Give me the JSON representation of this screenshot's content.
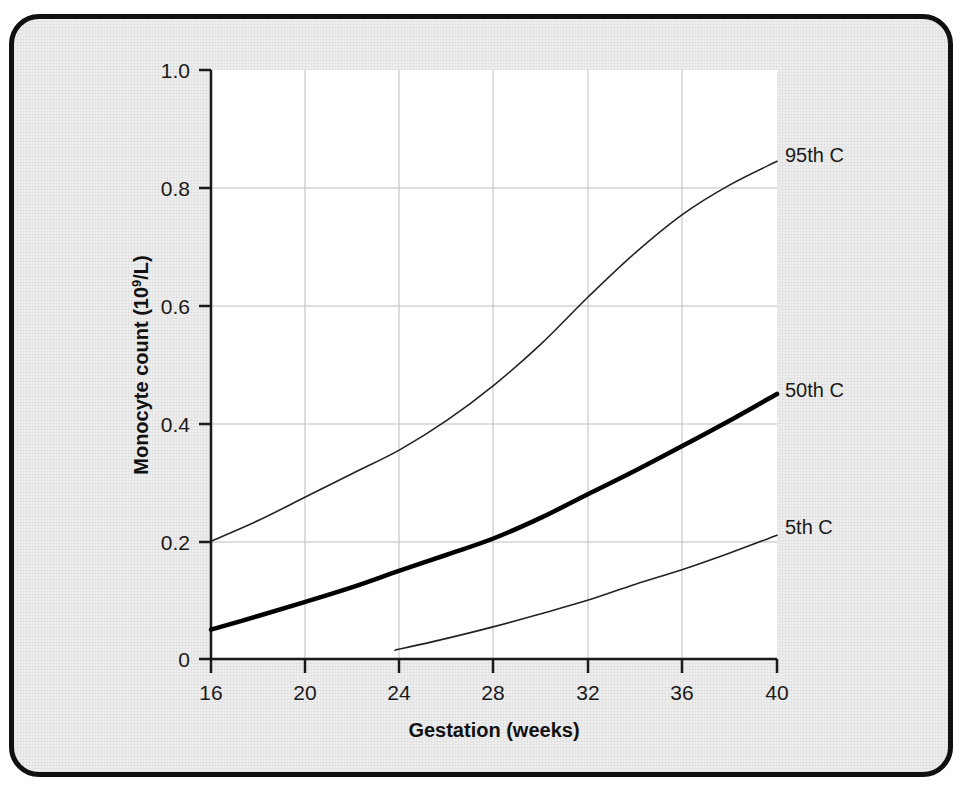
{
  "figure": {
    "frame_color": "#111111",
    "background_color": "#eeeeee",
    "plot_background_color": "#ffffff",
    "grid_color": "#b9b9b9",
    "axis_color": "#1a1a1a"
  },
  "axes": {
    "y_title_main": "Monocyte count (10",
    "y_title_sup": "9",
    "y_title_tail": "/L)",
    "y_title_full": "Monocyte count (10⁹/L)",
    "x_title": "Gestation (weeks)",
    "y_ticks": [
      "0",
      "0.2",
      "0.4",
      "0.6",
      "0.8",
      "1.0"
    ],
    "x_ticks": [
      "16",
      "20",
      "24",
      "28",
      "32",
      "36",
      "40"
    ]
  },
  "labels": {
    "p95": "95th C",
    "p50": "50th C",
    "p5": "5th C"
  },
  "chart_data": {
    "type": "line",
    "title": "",
    "subtitle": "",
    "xlabel": "Gestation (weeks)",
    "ylabel": "Monocyte count (10⁹/L)",
    "xlim": [
      16,
      40
    ],
    "ylim": [
      0,
      1.0
    ],
    "xticks": [
      16,
      20,
      24,
      28,
      32,
      36,
      40
    ],
    "yticks": [
      0,
      0.2,
      0.4,
      0.6,
      0.8,
      1.0
    ],
    "grid": true,
    "legend_position": "right-inline-labels",
    "x": [
      16,
      18,
      20,
      22,
      24,
      26,
      28,
      30,
      32,
      34,
      36,
      38,
      40
    ],
    "series": [
      {
        "name": "95th C",
        "label": "95th C",
        "color": "#222222",
        "line_width": 1.6,
        "x": [
          16,
          18,
          20,
          22,
          24,
          26,
          28,
          30,
          32,
          34,
          36,
          38,
          40
        ],
        "values": [
          0.2,
          0.235,
          0.275,
          0.315,
          0.355,
          0.405,
          0.465,
          0.535,
          0.615,
          0.69,
          0.755,
          0.805,
          0.845
        ]
      },
      {
        "name": "50th C",
        "label": "50th C",
        "color": "#000000",
        "line_width": 4.5,
        "x": [
          16,
          18,
          20,
          22,
          24,
          26,
          28,
          30,
          32,
          34,
          36,
          38,
          40
        ],
        "values": [
          0.05,
          0.073,
          0.097,
          0.122,
          0.15,
          0.177,
          0.205,
          0.24,
          0.28,
          0.32,
          0.362,
          0.405,
          0.45
        ]
      },
      {
        "name": "5th C",
        "label": "5th C",
        "color": "#222222",
        "line_width": 1.6,
        "x": [
          23.8,
          26,
          28,
          30,
          32,
          34,
          36,
          38,
          40
        ],
        "values": [
          0.015,
          0.035,
          0.055,
          0.077,
          0.1,
          0.127,
          0.152,
          0.18,
          0.21
        ]
      }
    ]
  }
}
